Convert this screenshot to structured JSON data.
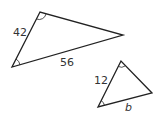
{
  "diagram": {
    "large_triangle": {
      "vertices": [
        [
          40,
          12
        ],
        [
          12,
          67
        ],
        [
          123,
          35
        ]
      ],
      "side_labels": {
        "left": "42",
        "bottom": "56"
      },
      "angle_marks": [
        "top",
        "bottom-left"
      ]
    },
    "small_triangle": {
      "vertices": [
        [
          121,
          61
        ],
        [
          98,
          107
        ],
        [
          152,
          93
        ]
      ],
      "side_labels": {
        "left": "12",
        "bottom": "b"
      },
      "angle_marks": [
        "top",
        "bottom-left"
      ]
    },
    "colors": {
      "stroke": "#222222",
      "text": "#333333",
      "background": "#ffffff"
    }
  }
}
